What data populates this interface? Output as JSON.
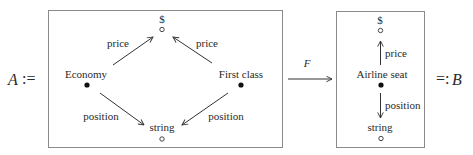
{
  "equation": {
    "left_symbol": "A",
    "left_operator": ":=",
    "right_operator": "=:",
    "right_symbol": "B",
    "functor_label": "F"
  },
  "diagram_a": {
    "nodes": [
      {
        "id": "dollar",
        "label": "$",
        "type": "open"
      },
      {
        "id": "economy",
        "label": "Economy",
        "type": "filled"
      },
      {
        "id": "first_class",
        "label": "First class",
        "type": "filled"
      },
      {
        "id": "string",
        "label": "string",
        "type": "open"
      }
    ],
    "edges": [
      {
        "from": "economy",
        "to": "dollar",
        "label": "price"
      },
      {
        "from": "first_class",
        "to": "dollar",
        "label": "price"
      },
      {
        "from": "economy",
        "to": "string",
        "label": "position"
      },
      {
        "from": "first_class",
        "to": "string",
        "label": "position"
      }
    ]
  },
  "diagram_b": {
    "nodes": [
      {
        "id": "dollar",
        "label": "$",
        "type": "open"
      },
      {
        "id": "airline_seat",
        "label": "Airline seat",
        "type": "filled"
      },
      {
        "id": "string",
        "label": "string",
        "type": "open"
      }
    ],
    "edges": [
      {
        "from": "airline_seat",
        "to": "dollar",
        "label": "price"
      },
      {
        "from": "airline_seat",
        "to": "string",
        "label": "position"
      }
    ]
  },
  "colors": {
    "ink": "#2a2a2a",
    "box_border": "#8a8a8a",
    "background": "#ffffff"
  }
}
